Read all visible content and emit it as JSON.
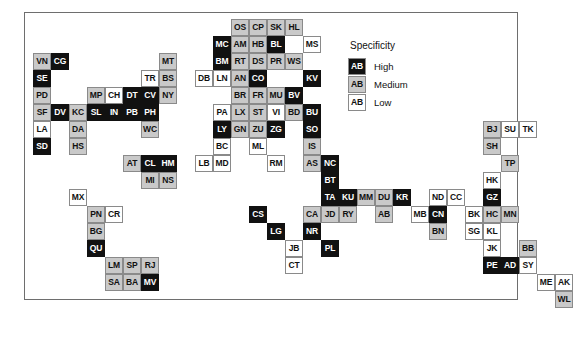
{
  "chart_data": {
    "type": "heatmap",
    "title": "",
    "xlabel": "",
    "ylabel": "",
    "grid": false,
    "legend_position": "top-right",
    "legend": {
      "title": "Specificity",
      "sample_text": "AB",
      "entries": [
        {
          "label": "High",
          "level": "high",
          "color": "#111111"
        },
        {
          "label": "Medium",
          "level": "medium",
          "color": "#c9c9c9"
        },
        {
          "label": "Low",
          "level": "low",
          "color": "#ffffff"
        }
      ]
    },
    "cell_size": [
      18,
      17
    ],
    "categories": [
      "high",
      "medium",
      "low"
    ],
    "cells": [
      {
        "code": "VN",
        "level": "medium",
        "col": 0,
        "row": 2
      },
      {
        "code": "CG",
        "level": "high",
        "col": 1,
        "row": 2
      },
      {
        "code": "SE",
        "level": "high",
        "col": 0,
        "row": 3
      },
      {
        "code": "PD",
        "level": "medium",
        "col": 0,
        "row": 4
      },
      {
        "code": "MP",
        "level": "medium",
        "col": 3,
        "row": 4
      },
      {
        "code": "CH",
        "level": "low",
        "col": 4,
        "row": 4
      },
      {
        "code": "DT",
        "level": "high",
        "col": 5,
        "row": 4
      },
      {
        "code": "CV",
        "level": "high",
        "col": 6,
        "row": 4
      },
      {
        "code": "NY",
        "level": "medium",
        "col": 7,
        "row": 4
      },
      {
        "code": "TR",
        "level": "low",
        "col": 6,
        "row": 3
      },
      {
        "code": "BS",
        "level": "medium",
        "col": 7,
        "row": 3
      },
      {
        "code": "MT",
        "level": "medium",
        "col": 7,
        "row": 2
      },
      {
        "code": "SF",
        "level": "medium",
        "col": 0,
        "row": 5
      },
      {
        "code": "DV",
        "level": "high",
        "col": 1,
        "row": 5
      },
      {
        "code": "KC",
        "level": "medium",
        "col": 2,
        "row": 5
      },
      {
        "code": "SL",
        "level": "high",
        "col": 3,
        "row": 5
      },
      {
        "code": "IN",
        "level": "high",
        "col": 4,
        "row": 5
      },
      {
        "code": "PB",
        "level": "high",
        "col": 5,
        "row": 5
      },
      {
        "code": "PH",
        "level": "high",
        "col": 6,
        "row": 5
      },
      {
        "code": "LA",
        "level": "low",
        "col": 0,
        "row": 6
      },
      {
        "code": "DA",
        "level": "medium",
        "col": 2,
        "row": 6
      },
      {
        "code": "WC",
        "level": "medium",
        "col": 6,
        "row": 6
      },
      {
        "code": "SD",
        "level": "high",
        "col": 0,
        "row": 7
      },
      {
        "code": "HS",
        "level": "medium",
        "col": 2,
        "row": 7
      },
      {
        "code": "AT",
        "level": "medium",
        "col": 5,
        "row": 8
      },
      {
        "code": "CL",
        "level": "high",
        "col": 6,
        "row": 8
      },
      {
        "code": "HM",
        "level": "high",
        "col": 7,
        "row": 8
      },
      {
        "code": "MI",
        "level": "medium",
        "col": 6,
        "row": 9
      },
      {
        "code": "NS",
        "level": "medium",
        "col": 7,
        "row": 9
      },
      {
        "code": "MX",
        "level": "low",
        "col": 2,
        "row": 10
      },
      {
        "code": "PN",
        "level": "medium",
        "col": 3,
        "row": 11
      },
      {
        "code": "CR",
        "level": "low",
        "col": 4,
        "row": 11
      },
      {
        "code": "BG",
        "level": "medium",
        "col": 3,
        "row": 12
      },
      {
        "code": "QU",
        "level": "high",
        "col": 3,
        "row": 13
      },
      {
        "code": "LM",
        "level": "medium",
        "col": 4,
        "row": 14
      },
      {
        "code": "SP",
        "level": "medium",
        "col": 5,
        "row": 14
      },
      {
        "code": "RJ",
        "level": "medium",
        "col": 6,
        "row": 14
      },
      {
        "code": "SA",
        "level": "medium",
        "col": 4,
        "row": 15
      },
      {
        "code": "BA",
        "level": "medium",
        "col": 5,
        "row": 15
      },
      {
        "code": "MV",
        "level": "high",
        "col": 6,
        "row": 15
      },
      {
        "code": "OS",
        "level": "medium",
        "col": 11,
        "row": 0
      },
      {
        "code": "CP",
        "level": "medium",
        "col": 12,
        "row": 0
      },
      {
        "code": "SK",
        "level": "medium",
        "col": 13,
        "row": 0
      },
      {
        "code": "HL",
        "level": "medium",
        "col": 14,
        "row": 0
      },
      {
        "code": "MC",
        "level": "high",
        "col": 10,
        "row": 1
      },
      {
        "code": "AM",
        "level": "medium",
        "col": 11,
        "row": 1
      },
      {
        "code": "HB",
        "level": "medium",
        "col": 12,
        "row": 1
      },
      {
        "code": "BL",
        "level": "high",
        "col": 13,
        "row": 1
      },
      {
        "code": "MS",
        "level": "low",
        "col": 15,
        "row": 1
      },
      {
        "code": "BM",
        "level": "high",
        "col": 10,
        "row": 2
      },
      {
        "code": "RT",
        "level": "medium",
        "col": 11,
        "row": 2
      },
      {
        "code": "DS",
        "level": "medium",
        "col": 12,
        "row": 2
      },
      {
        "code": "PR",
        "level": "medium",
        "col": 13,
        "row": 2
      },
      {
        "code": "WS",
        "level": "medium",
        "col": 14,
        "row": 2
      },
      {
        "code": "DB",
        "level": "low",
        "col": 9,
        "row": 3
      },
      {
        "code": "LN",
        "level": "low",
        "col": 10,
        "row": 3
      },
      {
        "code": "AN",
        "level": "medium",
        "col": 11,
        "row": 3
      },
      {
        "code": "CO",
        "level": "high",
        "col": 12,
        "row": 3
      },
      {
        "code": "KV",
        "level": "high",
        "col": 15,
        "row": 3
      },
      {
        "code": "BR",
        "level": "medium",
        "col": 11,
        "row": 4
      },
      {
        "code": "FR",
        "level": "medium",
        "col": 12,
        "row": 4
      },
      {
        "code": "MU",
        "level": "medium",
        "col": 13,
        "row": 4
      },
      {
        "code": "BV",
        "level": "high",
        "col": 14,
        "row": 4
      },
      {
        "code": "PA",
        "level": "low",
        "col": 10,
        "row": 5
      },
      {
        "code": "LX",
        "level": "medium",
        "col": 11,
        "row": 5
      },
      {
        "code": "ST",
        "level": "medium",
        "col": 12,
        "row": 5
      },
      {
        "code": "VI",
        "level": "low",
        "col": 13,
        "row": 5
      },
      {
        "code": "BD",
        "level": "medium",
        "col": 14,
        "row": 5
      },
      {
        "code": "BU",
        "level": "high",
        "col": 15,
        "row": 5
      },
      {
        "code": "LY",
        "level": "high",
        "col": 10,
        "row": 6
      },
      {
        "code": "GN",
        "level": "medium",
        "col": 11,
        "row": 6
      },
      {
        "code": "ZU",
        "level": "medium",
        "col": 12,
        "row": 6
      },
      {
        "code": "ZG",
        "level": "high",
        "col": 13,
        "row": 6
      },
      {
        "code": "SO",
        "level": "high",
        "col": 15,
        "row": 6
      },
      {
        "code": "BC",
        "level": "low",
        "col": 10,
        "row": 7
      },
      {
        "code": "ML",
        "level": "low",
        "col": 12,
        "row": 7
      },
      {
        "code": "IS",
        "level": "medium",
        "col": 15,
        "row": 7
      },
      {
        "code": "LB",
        "level": "low",
        "col": 9,
        "row": 8
      },
      {
        "code": "MD",
        "level": "low",
        "col": 10,
        "row": 8
      },
      {
        "code": "RM",
        "level": "low",
        "col": 13,
        "row": 8
      },
      {
        "code": "AS",
        "level": "medium",
        "col": 15,
        "row": 8
      },
      {
        "code": "NC",
        "level": "high",
        "col": 16,
        "row": 8
      },
      {
        "code": "BT",
        "level": "high",
        "col": 16,
        "row": 9
      },
      {
        "code": "TA",
        "level": "high",
        "col": 16,
        "row": 10
      },
      {
        "code": "KU",
        "level": "high",
        "col": 17,
        "row": 10
      },
      {
        "code": "MM",
        "level": "medium",
        "col": 18,
        "row": 10
      },
      {
        "code": "DU",
        "level": "medium",
        "col": 19,
        "row": 10
      },
      {
        "code": "KR",
        "level": "high",
        "col": 20,
        "row": 10
      },
      {
        "code": "ND",
        "level": "low",
        "col": 22,
        "row": 10
      },
      {
        "code": "CC",
        "level": "low",
        "col": 23,
        "row": 10
      },
      {
        "code": "CA",
        "level": "medium",
        "col": 15,
        "row": 11
      },
      {
        "code": "JD",
        "level": "medium",
        "col": 16,
        "row": 11
      },
      {
        "code": "RY",
        "level": "medium",
        "col": 17,
        "row": 11
      },
      {
        "code": "AB",
        "level": "medium",
        "col": 19,
        "row": 11
      },
      {
        "code": "MB",
        "level": "low",
        "col": 21,
        "row": 11
      },
      {
        "code": "CN",
        "level": "high",
        "col": 22,
        "row": 11
      },
      {
        "code": "CS",
        "level": "high",
        "col": 12,
        "row": 11
      },
      {
        "code": "LG",
        "level": "high",
        "col": 13,
        "row": 12
      },
      {
        "code": "NR",
        "level": "high",
        "col": 15,
        "row": 12
      },
      {
        "code": "BN",
        "level": "medium",
        "col": 22,
        "row": 12
      },
      {
        "code": "JB",
        "level": "low",
        "col": 14,
        "row": 13
      },
      {
        "code": "PL",
        "level": "high",
        "col": 16,
        "row": 13
      },
      {
        "code": "CT",
        "level": "low",
        "col": 14,
        "row": 14
      },
      {
        "code": "BJ",
        "level": "medium",
        "col": 25,
        "row": 6
      },
      {
        "code": "SU",
        "level": "low",
        "col": 26,
        "row": 6
      },
      {
        "code": "TK",
        "level": "low",
        "col": 27,
        "row": 6
      },
      {
        "code": "SH",
        "level": "medium",
        "col": 25,
        "row": 7
      },
      {
        "code": "TP",
        "level": "medium",
        "col": 26,
        "row": 8
      },
      {
        "code": "HK",
        "level": "low",
        "col": 25,
        "row": 9
      },
      {
        "code": "GZ",
        "level": "high",
        "col": 25,
        "row": 10
      },
      {
        "code": "MN",
        "level": "medium",
        "col": 26,
        "row": 11
      },
      {
        "code": "BK",
        "level": "low",
        "col": 24,
        "row": 11
      },
      {
        "code": "HC",
        "level": "medium",
        "col": 25,
        "row": 11
      },
      {
        "code": "SG",
        "level": "low",
        "col": 24,
        "row": 12
      },
      {
        "code": "KL",
        "level": "low",
        "col": 25,
        "row": 12
      },
      {
        "code": "JK",
        "level": "low",
        "col": 25,
        "row": 13
      },
      {
        "code": "PE",
        "level": "high",
        "col": 25,
        "row": 14
      },
      {
        "code": "AD",
        "level": "high",
        "col": 26,
        "row": 14
      },
      {
        "code": "BB",
        "level": "medium",
        "col": 27,
        "row": 13
      },
      {
        "code": "SY",
        "level": "low",
        "col": 27,
        "row": 14
      },
      {
        "code": "ME",
        "level": "low",
        "col": 28,
        "row": 15
      },
      {
        "code": "AK",
        "level": "low",
        "col": 29,
        "row": 15
      },
      {
        "code": "WL",
        "level": "medium",
        "col": 29,
        "row": 16
      }
    ]
  }
}
